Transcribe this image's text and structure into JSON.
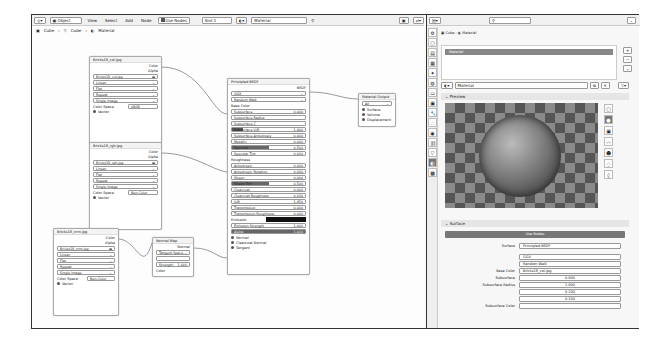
{
  "node_editor": {
    "header": {
      "editor_type_icon": "node-editor-icon",
      "mode": "Object",
      "menus": [
        "View",
        "Select",
        "Add",
        "Node"
      ],
      "use_nodes_label": "Use Nodes",
      "slot": "Slot 1",
      "material": "Material"
    },
    "breadcrumb": [
      "Cube",
      "Cube",
      "Material"
    ],
    "nodes": {
      "tex1": {
        "title": "Bricks18_col.jpg",
        "out_color": "Color",
        "out_alpha": "Alpha",
        "image": "Bricks18_col.jpg",
        "interp": "Linear",
        "proj": "Flat",
        "ext": "Repeat",
        "source": "Single Image",
        "cs_label": "Color Space",
        "cs": "sRGB",
        "vector": "Vector"
      },
      "tex2": {
        "title": "Bricks18_rgh.jpg",
        "out_color": "Color",
        "out_alpha": "Alpha",
        "image": "Bricks18_rgh.jpg",
        "interp": "Linear",
        "proj": "Flat",
        "ext": "Repeat",
        "source": "Single Image",
        "cs_label": "Color Space",
        "cs": "Non-Color",
        "vector": "Vector"
      },
      "tex3": {
        "title": "Bricks18_nrm.jpg",
        "out_color": "Color",
        "out_alpha": "Alpha",
        "image": "Bricks18_nrm.jpg",
        "interp": "Linear",
        "proj": "Flat",
        "ext": "Repeat",
        "source": "Single Image",
        "cs_label": "Color Space",
        "cs": "Non-Color",
        "vector": "Vector"
      },
      "normal_map": {
        "title": "Normal Map",
        "out": "Normal",
        "space": "Tangent Space",
        "uv": "",
        "strength_label": "Strength",
        "strength": "1.000",
        "color": "Color"
      },
      "bsdf": {
        "title": "Principled BSDF",
        "out": "BSDF",
        "distribution": "GGX",
        "subsurface_method": "Random Walk",
        "base_color": "Base Color",
        "rows": [
          {
            "label": "Subsurface",
            "value": "0.000"
          },
          {
            "label": "Subsurface Radius",
            "value": ""
          },
          {
            "label": "Subsurface C",
            "value": ""
          },
          {
            "label": "Subsurface IOR",
            "value": "1.400"
          },
          {
            "label": "Subsurface Anisotropy",
            "value": "0.000"
          },
          {
            "label": "Metallic",
            "value": "0.000"
          },
          {
            "label": "Specular",
            "value": "0.500"
          },
          {
            "label": "Specular Tint",
            "value": "0.000"
          }
        ],
        "roughness": "Roughness",
        "rows2": [
          {
            "label": "Anisotropic",
            "value": "0.000"
          },
          {
            "label": "Anisotropic Rotation",
            "value": "0.000"
          },
          {
            "label": "Sheen",
            "value": "0.000"
          },
          {
            "label": "Sheen Tint",
            "value": "0.500"
          },
          {
            "label": "Clearcoat",
            "value": "0.000"
          },
          {
            "label": "Clearcoat Roughness",
            "value": "0.030"
          },
          {
            "label": "IOR",
            "value": "1.450"
          },
          {
            "label": "Transmission",
            "value": "0.000"
          },
          {
            "label": "Transmission Roughness",
            "value": "0.000"
          }
        ],
        "emission": "Emission",
        "emission_strength_label": "Emission Strength",
        "emission_strength": "1.000",
        "alpha_label": "Alpha",
        "alpha": "1.000",
        "normal": "Normal",
        "clearcoat_normal": "Clearcoat Normal",
        "tangent": "Tangent"
      },
      "output": {
        "title": "Material Output",
        "target": "All",
        "surface": "Surface",
        "volume": "Volume",
        "displacement": "Displacement"
      }
    }
  },
  "properties": {
    "search_placeholder": "",
    "breadcrumb": [
      "Cube",
      "Material"
    ],
    "slot_item": "Material",
    "material_name": "Material",
    "preview_label": "Preview",
    "surface_label": "Surface",
    "use_nodes_label": "Use Nodes",
    "rows": [
      {
        "label": "Surface",
        "value": "Principled BSDF"
      },
      {
        "label": "",
        "value": "GGX"
      },
      {
        "label": "",
        "value": "Random Walk"
      },
      {
        "label": "Base Color",
        "value": "Bricks18_col.jpg"
      },
      {
        "label": "Subsurface",
        "value": "0.000"
      },
      {
        "label": "Subsurface Radius",
        "value": "1.000"
      },
      {
        "label": "",
        "value": "0.200"
      },
      {
        "label": "",
        "value": "0.100"
      },
      {
        "label": "Subsurface Color",
        "value": ""
      }
    ]
  }
}
